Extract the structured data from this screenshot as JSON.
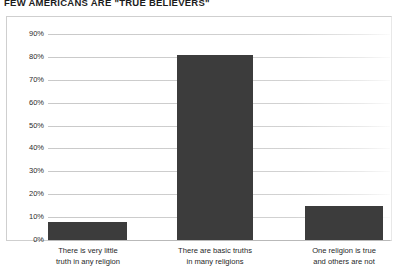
{
  "chart_data": {
    "type": "bar",
    "title": "FEW AMERICANS ARE \"TRUE BELIEVERS\"",
    "categories": [
      "There is very little truth in any religion",
      "There are basic truths in many religions",
      "One religion is true and others are not"
    ],
    "category_lines": [
      [
        "There is very little",
        "truth in any religion"
      ],
      [
        "There are basic truths",
        "in many religions"
      ],
      [
        "One religion is true",
        "and others are not"
      ]
    ],
    "values": [
      8,
      81,
      15
    ],
    "value_labels": [
      "8%",
      "81%",
      "15%"
    ],
    "xlabel": "",
    "ylabel": "",
    "ylim": [
      0,
      95
    ],
    "y_ticks": [
      0,
      10,
      20,
      30,
      40,
      50,
      60,
      70,
      80,
      90
    ],
    "y_tick_labels": [
      "0%",
      "10%",
      "20%",
      "30%",
      "40%",
      "50%",
      "60%",
      "70%",
      "80%",
      "90%"
    ],
    "grid": true,
    "grid_axis": "y",
    "legend": false,
    "legend_position": "none",
    "bar_color": "#3c3c3c",
    "gridline_color": "#cccccc",
    "frame_color": "#cfcfcf",
    "background_color": "#ffffff",
    "text_color": "#1f1f1f"
  },
  "labels": {
    "y_tick_0": "0%",
    "y_tick_1": "10%",
    "y_tick_2": "20%",
    "y_tick_3": "30%",
    "y_tick_4": "40%",
    "y_tick_5": "50%",
    "y_tick_6": "60%",
    "y_tick_7": "70%",
    "y_tick_8": "80%",
    "y_tick_9": "90%"
  }
}
